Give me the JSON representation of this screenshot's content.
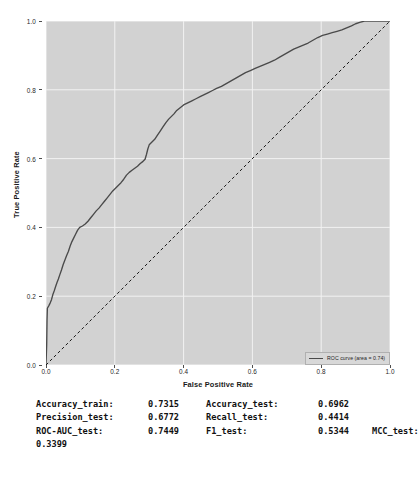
{
  "chart_data": {
    "type": "line",
    "title": "",
    "xlabel": "False Positive Rate",
    "ylabel": "True Positive Rate",
    "xlim": [
      0.0,
      1.0
    ],
    "ylim": [
      0.0,
      1.0
    ],
    "grid": true,
    "legend_position": "lower right",
    "xticks": [
      "0.0",
      "0.2",
      "0.4",
      "0.6",
      "0.8",
      "1.0"
    ],
    "xtick_values": [
      0.0,
      0.2,
      0.4,
      0.6,
      0.8,
      1.0
    ],
    "yticks": [
      "0.0",
      "0.2",
      "0.4",
      "0.6",
      "0.8",
      "1.0"
    ],
    "ytick_values": [
      0.0,
      0.2,
      0.4,
      0.6,
      0.8,
      1.0
    ],
    "series": [
      {
        "name": "ROC curve (area = 0.74)",
        "style": "solid",
        "color": "#4a4a4a",
        "points": [
          [
            0.0,
            0.0
          ],
          [
            0.002,
            0.06
          ],
          [
            0.003,
            0.13
          ],
          [
            0.004,
            0.165
          ],
          [
            0.008,
            0.172
          ],
          [
            0.012,
            0.18
          ],
          [
            0.016,
            0.19
          ],
          [
            0.02,
            0.205
          ],
          [
            0.024,
            0.216
          ],
          [
            0.028,
            0.228
          ],
          [
            0.032,
            0.24
          ],
          [
            0.036,
            0.25
          ],
          [
            0.04,
            0.262
          ],
          [
            0.045,
            0.276
          ],
          [
            0.05,
            0.292
          ],
          [
            0.055,
            0.305
          ],
          [
            0.06,
            0.318
          ],
          [
            0.065,
            0.33
          ],
          [
            0.07,
            0.345
          ],
          [
            0.075,
            0.358
          ],
          [
            0.08,
            0.368
          ],
          [
            0.086,
            0.38
          ],
          [
            0.092,
            0.392
          ],
          [
            0.098,
            0.4
          ],
          [
            0.106,
            0.404
          ],
          [
            0.114,
            0.41
          ],
          [
            0.122,
            0.418
          ],
          [
            0.13,
            0.428
          ],
          [
            0.138,
            0.438
          ],
          [
            0.146,
            0.448
          ],
          [
            0.154,
            0.456
          ],
          [
            0.162,
            0.466
          ],
          [
            0.17,
            0.476
          ],
          [
            0.178,
            0.486
          ],
          [
            0.186,
            0.496
          ],
          [
            0.194,
            0.506
          ],
          [
            0.202,
            0.514
          ],
          [
            0.21,
            0.522
          ],
          [
            0.218,
            0.53
          ],
          [
            0.226,
            0.54
          ],
          [
            0.234,
            0.552
          ],
          [
            0.242,
            0.56
          ],
          [
            0.25,
            0.566
          ],
          [
            0.258,
            0.572
          ],
          [
            0.266,
            0.578
          ],
          [
            0.274,
            0.586
          ],
          [
            0.282,
            0.592
          ],
          [
            0.288,
            0.598
          ],
          [
            0.292,
            0.612
          ],
          [
            0.296,
            0.628
          ],
          [
            0.3,
            0.64
          ],
          [
            0.308,
            0.648
          ],
          [
            0.316,
            0.656
          ],
          [
            0.324,
            0.668
          ],
          [
            0.332,
            0.68
          ],
          [
            0.34,
            0.692
          ],
          [
            0.348,
            0.704
          ],
          [
            0.356,
            0.714
          ],
          [
            0.364,
            0.722
          ],
          [
            0.372,
            0.73
          ],
          [
            0.38,
            0.74
          ],
          [
            0.39,
            0.748
          ],
          [
            0.4,
            0.756
          ],
          [
            0.412,
            0.762
          ],
          [
            0.424,
            0.768
          ],
          [
            0.436,
            0.774
          ],
          [
            0.448,
            0.78
          ],
          [
            0.46,
            0.786
          ],
          [
            0.472,
            0.792
          ],
          [
            0.484,
            0.798
          ],
          [
            0.496,
            0.804
          ],
          [
            0.51,
            0.81
          ],
          [
            0.524,
            0.818
          ],
          [
            0.538,
            0.826
          ],
          [
            0.552,
            0.834
          ],
          [
            0.566,
            0.842
          ],
          [
            0.58,
            0.85
          ],
          [
            0.594,
            0.856
          ],
          [
            0.608,
            0.862
          ],
          [
            0.622,
            0.868
          ],
          [
            0.636,
            0.874
          ],
          [
            0.65,
            0.88
          ],
          [
            0.664,
            0.886
          ],
          [
            0.678,
            0.894
          ],
          [
            0.692,
            0.902
          ],
          [
            0.706,
            0.91
          ],
          [
            0.72,
            0.918
          ],
          [
            0.734,
            0.924
          ],
          [
            0.748,
            0.93
          ],
          [
            0.762,
            0.936
          ],
          [
            0.776,
            0.944
          ],
          [
            0.79,
            0.952
          ],
          [
            0.804,
            0.958
          ],
          [
            0.818,
            0.962
          ],
          [
            0.832,
            0.966
          ],
          [
            0.846,
            0.97
          ],
          [
            0.86,
            0.974
          ],
          [
            0.874,
            0.98
          ],
          [
            0.888,
            0.986
          ],
          [
            0.9,
            0.992
          ],
          [
            0.912,
            0.996
          ],
          [
            0.926,
            1.0
          ],
          [
            0.96,
            1.0
          ],
          [
            1.0,
            1.0
          ]
        ]
      },
      {
        "name": "chance",
        "style": "dashed",
        "color": "#1a1a1a",
        "points": [
          [
            0.0,
            0.0
          ],
          [
            1.0,
            1.0
          ]
        ]
      }
    ],
    "legend": [
      {
        "label": "ROC curve (area = 0.74)",
        "color": "#4a4a4a",
        "style": "solid"
      }
    ],
    "panel_color": "#d2d2d2",
    "grid_color": "#f2f2f2"
  },
  "metrics": {
    "rows": [
      {
        "key1": "Accuracy_train:",
        "val1": "0.7315",
        "key2": "Accuracy_test:",
        "val2": "0.6962",
        "key3": ""
      },
      {
        "key1": "Precision_test:",
        "val1": "0.6772",
        "key2": "Recall_test:",
        "val2": "0.4414",
        "key3": ""
      },
      {
        "key1": "ROC-AUC_test:",
        "val1": "0.7449",
        "key2": "F1_test:",
        "val2": "0.5344",
        "key3": "MCC_test:"
      }
    ],
    "wrapped_value": "0.3399"
  }
}
